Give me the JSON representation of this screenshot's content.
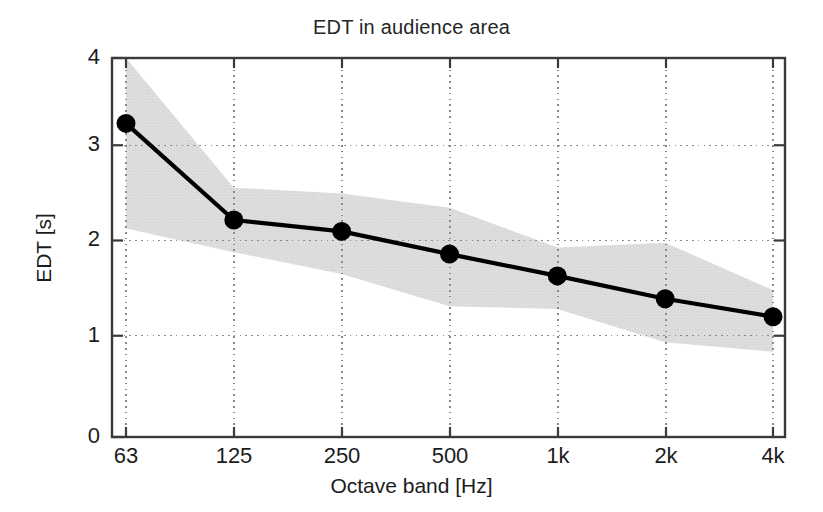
{
  "chart_data": {
    "type": "line",
    "title": "EDT in audience area",
    "xlabel": "Octave band [Hz]",
    "ylabel": "EDT [s]",
    "categories": [
      "63",
      "125",
      "250",
      "500",
      "1k",
      "2k",
      "4k"
    ],
    "values": [
      3.31,
      2.29,
      2.17,
      1.93,
      1.7,
      1.46,
      1.27
    ],
    "series": [
      {
        "name": "EDT mean",
        "values": [
          3.31,
          2.29,
          2.17,
          1.93,
          1.7,
          1.46,
          1.27
        ],
        "marker": "filled-circle",
        "color": "#000000"
      },
      {
        "name": "EDT range (shaded band upper)",
        "values": [
          4.0,
          2.63,
          2.57,
          2.42,
          2.0,
          2.05,
          1.55
        ],
        "color": "#d9d9d9"
      },
      {
        "name": "EDT range (shaded band lower)",
        "values": [
          2.2,
          1.95,
          1.72,
          1.38,
          1.35,
          1.0,
          0.9
        ],
        "color": "#d9d9d9"
      }
    ],
    "ylim": [
      0,
      4
    ],
    "yticks": [
      "0",
      "1",
      "2",
      "3",
      "4"
    ],
    "grid": true,
    "grid_style": "dotted",
    "legend": "none",
    "band_clipped_at_top": true,
    "band_fill_color": "#dcdcdc",
    "line_color": "#000000",
    "axis_color": "#333333"
  },
  "axis": {
    "y_ticks": [
      {
        "label": "4",
        "value": 4
      },
      {
        "label": "3",
        "value": 3
      },
      {
        "label": "2",
        "value": 2
      },
      {
        "label": "1",
        "value": 1
      },
      {
        "label": "0",
        "value": 0
      }
    ],
    "x_ticks": [
      {
        "label": "63"
      },
      {
        "label": "125"
      },
      {
        "label": "250"
      },
      {
        "label": "500"
      },
      {
        "label": "1k"
      },
      {
        "label": "2k"
      },
      {
        "label": "4k"
      }
    ]
  }
}
